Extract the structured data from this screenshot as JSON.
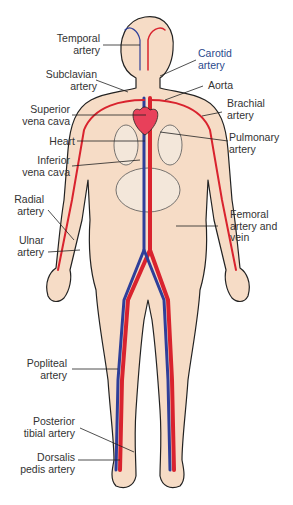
{
  "diagram": {
    "colors": {
      "skin": "#f6dcc6",
      "outline": "#222222",
      "artery": "#d9232e",
      "vein": "#2e3f9a",
      "heart": "#e8405a",
      "organ": "#f3e7da",
      "label_text": "#333333"
    },
    "labels_left": [
      {
        "id": "temporal-artery",
        "line1": "Temporal",
        "line2": "artery"
      },
      {
        "id": "subclavian-artery",
        "line1": "Subclavian",
        "line2": "artery"
      },
      {
        "id": "superior-vena-cava",
        "line1": "Superior",
        "line2": "vena cava"
      },
      {
        "id": "heart",
        "line1": "Heart",
        "line2": ""
      },
      {
        "id": "inferior-vena-cava",
        "line1": "Inferior",
        "line2": "vena cava"
      },
      {
        "id": "radial-artery",
        "line1": "Radial",
        "line2": "artery"
      },
      {
        "id": "ulnar-artery",
        "line1": "Ulnar",
        "line2": "artery"
      },
      {
        "id": "popliteal-artery",
        "line1": "Popliteal",
        "line2": "artery"
      },
      {
        "id": "posterior-tibial-artery",
        "line1": "Posterior",
        "line2": "tibial artery"
      },
      {
        "id": "dorsalis-pedis-artery",
        "line1": "Dorsalis",
        "line2": "pedis artery"
      }
    ],
    "labels_right": [
      {
        "id": "carotid-artery",
        "line1": "Carotid",
        "line2": "artery"
      },
      {
        "id": "aorta",
        "line1": "Aorta",
        "line2": ""
      },
      {
        "id": "brachial-artery",
        "line1": "Brachial",
        "line2": "artery"
      },
      {
        "id": "pulmonary-artery",
        "line1": "Pulmonary",
        "line2": "artery"
      },
      {
        "id": "femoral-artery-and-vein",
        "line1": "Femoral",
        "line2": "artery and",
        "line3": "vein"
      }
    ]
  }
}
